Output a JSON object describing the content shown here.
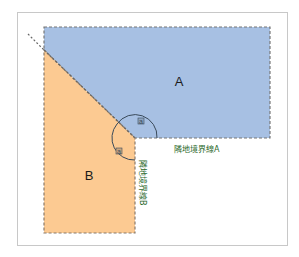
{
  "diagram": {
    "regions": [
      {
        "id": "A",
        "label": "A",
        "color": "#a7c0e3"
      },
      {
        "id": "B",
        "label": "B",
        "color": "#fcca92"
      }
    ],
    "boundaries": [
      {
        "id": "boundary-a",
        "label": "隣地境界線A",
        "orientation": "horizontal"
      },
      {
        "id": "boundary-b",
        "label": "隣地境界線B",
        "orientation": "vertical"
      }
    ],
    "angles": [
      {
        "id": "angle-a-upper",
        "label": "a"
      },
      {
        "id": "angle-a-lower",
        "label": "a"
      }
    ],
    "colors": {
      "frame": "#c8c8c8",
      "dashed_border": "#777777",
      "boundary_text": "#2e6b2e",
      "arc": "#3a4a5a"
    }
  }
}
